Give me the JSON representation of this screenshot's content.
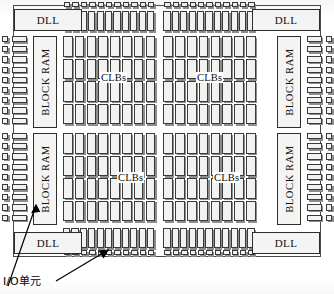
{
  "diagram": {
    "annotation": "I/O单元",
    "labels": {
      "dll": "DLL",
      "block_ram": "BLOCK RAM",
      "clbs": "CLBs"
    },
    "blocks": {
      "dll": [
        {
          "id": "dll-top-left",
          "label": "DLL",
          "x": 14,
          "y": 9,
          "w": 68,
          "h": 22
        },
        {
          "id": "dll-top-right",
          "label": "DLL",
          "x": 252,
          "y": 9,
          "w": 68,
          "h": 22
        },
        {
          "id": "dll-bottom-left",
          "label": "DLL",
          "x": 14,
          "y": 232,
          "w": 68,
          "h": 22
        },
        {
          "id": "dll-bottom-right",
          "label": "DLL",
          "x": 252,
          "y": 232,
          "w": 68,
          "h": 22
        }
      ],
      "block_ram": [
        {
          "id": "bram-upper-left",
          "label": "BLOCK RAM",
          "x": 33,
          "y": 36,
          "w": 24,
          "h": 92
        },
        {
          "id": "bram-upper-right",
          "label": "BLOCK RAM",
          "x": 277,
          "y": 36,
          "w": 24,
          "h": 92
        },
        {
          "id": "bram-lower-left",
          "label": "BLOCK RAM",
          "x": 33,
          "y": 133,
          "w": 24,
          "h": 92
        },
        {
          "id": "bram-lower-right",
          "label": "BLOCK RAM",
          "x": 277,
          "y": 133,
          "w": 24,
          "h": 92
        }
      ],
      "clb_quadrants": [
        {
          "id": "clbs-upper-left",
          "label": "CLBs",
          "label_x": 100,
          "label_y": 78
        },
        {
          "id": "clbs-upper-right",
          "label": "CLBs",
          "label_x": 196,
          "label_y": 78
        },
        {
          "id": "clbs-lower-left",
          "label": "CLBs",
          "label_x": 117,
          "label_y": 178
        },
        {
          "id": "clbs-lower-right",
          "label": "CLBs",
          "label_x": 213,
          "label_y": 178
        }
      ]
    },
    "grid": {
      "clb_columns_left": 8,
      "clb_columns_right": 8,
      "clb_rows_upper": 4,
      "clb_rows_lower": 4,
      "io_pads_top_left_group": 11,
      "io_pads_top_right_group": 11,
      "io_pads_bottom_left_group": 11,
      "io_pads_bottom_right_group": 11,
      "io_cells_top_left_group": 11,
      "io_cells_top_right_group": 11,
      "io_rows_left_upper": 9,
      "io_rows_left_lower": 9,
      "io_rows_right_upper": 9,
      "io_rows_right_lower": 9
    },
    "colors": {
      "cell_fill": "#f2f2f0",
      "cell_stroke": "#3a3a3a",
      "shadow": "#8d8d8d",
      "background": "#ffffff",
      "text": "#111111"
    }
  }
}
